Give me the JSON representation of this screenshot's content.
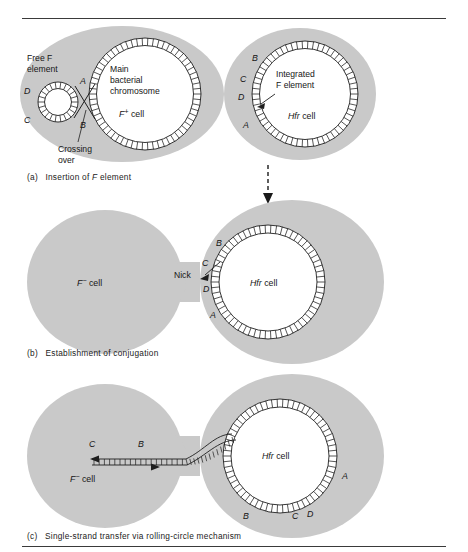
{
  "figure": {
    "title_present": false,
    "colors": {
      "cell_fill": "#c9c9c9",
      "cell_fill_light": "#cfcfcf",
      "chromosome_fill": "#ffffff",
      "line": "#1e1e1e",
      "text": "#161616",
      "rule": "#3a3a3a",
      "page_background": "#ffffff"
    }
  },
  "panels": [
    {
      "id": "a",
      "caption_prefix": "(a)",
      "caption_text": "Insertion of F element",
      "caption_italic_token": "F",
      "cells": [
        {
          "name": "f-plus-cell",
          "cell_label": "F⁺ cell",
          "annotations": [
            {
              "name": "free-f-element-label",
              "text": "Free F\nelement",
              "line1": "Free F",
              "line2": "element"
            },
            {
              "name": "main-chromosome-label",
              "line1": "Main",
              "line2": "bacterial",
              "line3": "chromosome"
            },
            {
              "name": "crossing-over-label",
              "line1": "Crossing",
              "line2": "over"
            }
          ],
          "gene_markers": [
            "A",
            "B",
            "C",
            "D"
          ]
        },
        {
          "name": "hfr-cell",
          "cell_label": "Hfr cell",
          "annotations": [
            {
              "name": "integrated-f-element-label",
              "line1": "Integrated",
              "line2": "F element"
            }
          ],
          "gene_markers": [
            "A",
            "B",
            "C",
            "D"
          ]
        }
      ],
      "transition_arrow": "right-arrow"
    },
    {
      "id": "b",
      "caption_prefix": "(b)",
      "caption_text": "Establishment of conjugation",
      "cells": [
        {
          "name": "f-minus-cell",
          "cell_label": "F⁻ cell"
        },
        {
          "name": "hfr-cell",
          "cell_label": "Hfr cell",
          "gene_markers": [
            "A",
            "B",
            "C",
            "D"
          ]
        }
      ],
      "annotations": [
        {
          "name": "nick-label",
          "text": "Nick"
        }
      ],
      "transition_arrow": "dashed-down-arrow"
    },
    {
      "id": "c",
      "caption_prefix": "(c)",
      "caption_text": "Single-strand transfer via rolling-circle mechanism",
      "cells": [
        {
          "name": "f-minus-cell",
          "cell_label": "F⁻ cell",
          "transferred_markers": [
            "C",
            "B"
          ]
        },
        {
          "name": "hfr-cell",
          "cell_label": "Hfr cell",
          "gene_markers": [
            "A",
            "B",
            "C",
            "D"
          ]
        }
      ]
    }
  ],
  "labels": {
    "free_f_line1": "Free F",
    "free_f_line2": "element",
    "main_chrom_line1": "Main",
    "main_chrom_line2": "bacterial",
    "main_chrom_line3": "chromosome",
    "crossing_line1": "Crossing",
    "crossing_line2": "over",
    "integrated_line1": "Integrated",
    "integrated_line2": "F element",
    "f_plus_cell": "F",
    "f_plus_sup": "+",
    "f_minus_sup": "−",
    "cell_word": "cell",
    "hfr": "Hfr",
    "nick": "Nick",
    "gene_a": "A",
    "gene_b": "B",
    "gene_c": "C",
    "gene_d": "D"
  },
  "captions": {
    "a_prefix": "(a)",
    "a_pre": "Insertion of ",
    "a_ital": "F",
    "a_post": " element",
    "b_prefix": "(b)",
    "b_text": "Establishment of conjugation",
    "c_prefix": "(c)",
    "c_text": "Single-strand transfer via rolling-circle mechanism"
  }
}
